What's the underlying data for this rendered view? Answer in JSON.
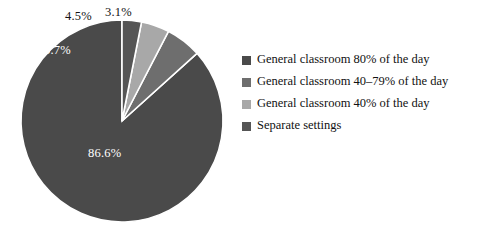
{
  "chart_data": {
    "type": "pie",
    "title": "",
    "subtitle": "",
    "xlabel": "",
    "ylabel": "",
    "grid": false,
    "legend_position": "right",
    "start_angle_deg": 0,
    "direction": "counterclockwise",
    "separator_color": "#ffffff",
    "background": "#ffffff",
    "categories": [
      "General classroom 80% of the day",
      "General classroom 40–79% of the day",
      "General classroom 40% of the day",
      "Separate settings"
    ],
    "values": [
      86.6,
      5.7,
      4.5,
      3.1
    ],
    "value_labels": [
      "86.6%",
      "5.7%",
      "4.5%",
      "3.1%"
    ],
    "colors": [
      "#4a4a4a",
      "#6e6e6e",
      "#a8a8a8",
      "#555555"
    ],
    "slices": [
      {
        "label": "General classroom 80% of the day",
        "value": 86.6,
        "value_label": "86.6%",
        "color": "#4a4a4a",
        "label_color": "#ffffff",
        "label_placement": "inside"
      },
      {
        "label": "General classroom 40–79% of the day",
        "value": 5.7,
        "value_label": "5.7%",
        "color": "#6e6e6e",
        "label_color": "#ffffff",
        "label_placement": "inside"
      },
      {
        "label": "General classroom 40% of the day",
        "value": 4.5,
        "value_label": "4.5%",
        "color": "#a8a8a8",
        "label_color": "#131313",
        "label_placement": "outside"
      },
      {
        "label": "Separate settings",
        "value": 3.1,
        "value_label": "3.1%",
        "color": "#555555",
        "label_color": "#131313",
        "label_placement": "outside"
      }
    ]
  },
  "legend": {
    "items": [
      {
        "label": "General classroom 80% of the day",
        "color": "#4a4a4a"
      },
      {
        "label": "General classroom 40–79% of the day",
        "color": "#6e6e6e"
      },
      {
        "label": "General classroom 40% of the day",
        "color": "#a8a8a8"
      },
      {
        "label": "Separate settings",
        "color": "#555555"
      }
    ]
  }
}
